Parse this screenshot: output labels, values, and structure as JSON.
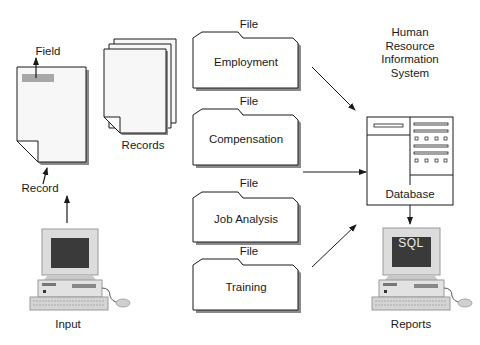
{
  "diagram": {
    "input_side": {
      "field_label": "Field",
      "record_label": "Record",
      "records_label": "Records",
      "input_label": "Input"
    },
    "files": [
      {
        "caption": "File",
        "name": "Employment"
      },
      {
        "caption": "File",
        "name": "Compensation"
      },
      {
        "caption": "File",
        "name": "Job Analysis"
      },
      {
        "caption": "File",
        "name": "Training"
      }
    ],
    "hris": {
      "title_lines": [
        "Human",
        "Resource",
        "Information",
        "System"
      ],
      "database_label": "Database",
      "screen_text": "SQL",
      "output_label": "Reports"
    },
    "colors": {
      "line": "#1a1a1a",
      "paper": "#f7f7f7",
      "shadow": "#8a8a8a",
      "field_highlight": "#a8a8a8",
      "screen": "#3a3a3a",
      "computer_body": "#dcdcdc"
    }
  }
}
